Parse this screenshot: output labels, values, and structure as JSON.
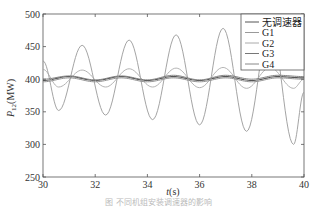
{
  "chart_data": {
    "type": "line",
    "title": "",
    "xlabel": "t(s)",
    "ylabel": "P12(MW)",
    "xlim": [
      30,
      40
    ],
    "ylim": [
      250,
      500
    ],
    "xticks": [
      30,
      32,
      34,
      36,
      38,
      40
    ],
    "yticks": [
      250,
      300,
      350,
      400,
      450,
      500
    ],
    "grid": false,
    "legend_position": "upper right",
    "series": [
      {
        "name": "无调速器",
        "color": "#555555",
        "x": [
          30,
          31,
          32,
          33,
          34,
          35,
          36,
          37,
          38,
          39,
          40
        ],
        "values": [
          398,
          404,
          398,
          404,
          398,
          404,
          398,
          404,
          398,
          404,
          402
        ]
      },
      {
        "name": "G1",
        "color": "#9a9a9a",
        "x": [
          30,
          30.6,
          31.5,
          32.4,
          33.3,
          34.2,
          35.1,
          36.0,
          36.9,
          37.8,
          38.7,
          39.6,
          40
        ],
        "values": [
          428,
          352,
          452,
          345,
          460,
          338,
          468,
          330,
          478,
          320,
          485,
          300,
          380
        ]
      },
      {
        "name": "G2",
        "color": "#aaaaaa",
        "x": [
          30,
          30.6,
          31.5,
          32.4,
          33.3,
          34.2,
          35.1,
          36.0,
          36.9,
          37.8,
          38.7,
          39.6,
          40
        ],
        "values": [
          415,
          388,
          414,
          388,
          416,
          388,
          417,
          387,
          418,
          386,
          418,
          386,
          400
        ]
      },
      {
        "name": "G3",
        "color": "#777777",
        "x": [
          30,
          31,
          32,
          33,
          34,
          35,
          36,
          37,
          38,
          39,
          40
        ],
        "values": [
          400,
          405,
          399,
          405,
          399,
          406,
          399,
          406,
          400,
          406,
          404
        ]
      },
      {
        "name": "G4",
        "color": "#888888",
        "x": [
          30,
          31,
          32,
          33,
          34,
          35,
          36,
          37,
          38,
          39,
          40
        ],
        "values": [
          396,
          402,
          396,
          402,
          396,
          402,
          396,
          402,
          396,
          402,
          400
        ]
      }
    ]
  },
  "labels": {
    "ylabel_main": "P",
    "ylabel_sub": "12",
    "ylabel_unit": "(MW)",
    "xlabel_var": "t",
    "xlabel_unit": "(s)"
  },
  "caption": "图 不同机组安装调速器的影响"
}
